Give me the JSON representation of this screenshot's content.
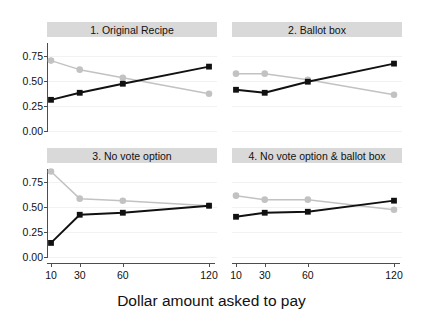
{
  "chart_data": {
    "type": "line",
    "title": "",
    "xlabel": "Dollar amount asked to pay",
    "ylabel": "",
    "x": [
      10,
      30,
      60,
      120
    ],
    "xticklabels": [
      "10",
      "30",
      "60",
      "120"
    ],
    "ylim": [
      0.0,
      0.875
    ],
    "yticks": [
      0.0,
      0.25,
      0.5,
      0.75
    ],
    "yticklabels": [
      "0.00",
      "0.25",
      "0.50",
      "0.75"
    ],
    "xlim": [
      10,
      120
    ],
    "grid": true,
    "legend": "none",
    "facet_layout": "2x2",
    "colors": {
      "series_dark": "#111111",
      "series_light": "#c2c2c2",
      "strip_background": "#d9d9d9",
      "gridline": "#f2f2f2",
      "axis": "#4d4d4d",
      "panel_background": "#ffffff"
    },
    "panels": [
      {
        "title": "1. Original Recipe",
        "series": [
          {
            "name": "dark",
            "marker": "square",
            "color": "#111111",
            "values": [
              0.31,
              0.38,
              0.47,
              0.64
            ]
          },
          {
            "name": "light",
            "marker": "circle",
            "color": "#c2c2c2",
            "values": [
              0.7,
              0.61,
              0.53,
              0.37
            ]
          }
        ]
      },
      {
        "title": "2. Ballot box",
        "series": [
          {
            "name": "dark",
            "marker": "square",
            "color": "#111111",
            "values": [
              0.41,
              0.38,
              0.49,
              0.67
            ]
          },
          {
            "name": "light",
            "marker": "circle",
            "color": "#c2c2c2",
            "values": [
              0.57,
              0.57,
              0.51,
              0.36
            ]
          }
        ]
      },
      {
        "title": "3. No vote option",
        "series": [
          {
            "name": "dark",
            "marker": "square",
            "color": "#111111",
            "values": [
              0.14,
              0.42,
              0.44,
              0.51
            ]
          },
          {
            "name": "light",
            "marker": "circle",
            "color": "#c2c2c2",
            "values": [
              0.85,
              0.58,
              0.56,
              0.51
            ]
          }
        ]
      },
      {
        "title": "4. No vote option & ballot box",
        "series": [
          {
            "name": "dark",
            "marker": "square",
            "color": "#111111",
            "values": [
              0.4,
              0.44,
              0.45,
              0.56
            ]
          },
          {
            "name": "light",
            "marker": "circle",
            "color": "#c2c2c2",
            "values": [
              0.61,
              0.57,
              0.57,
              0.47
            ]
          }
        ]
      }
    ]
  }
}
